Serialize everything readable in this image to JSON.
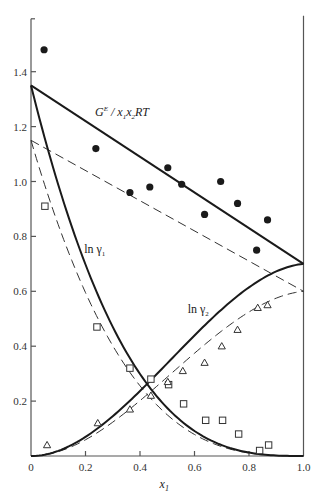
{
  "chart_data": {
    "type": "scatter",
    "title": "",
    "xlabel": "x1",
    "xlabel_display": {
      "base": "x",
      "sub": "1"
    },
    "ylabel": "",
    "xlim": [
      0,
      1.0
    ],
    "ylim": [
      0,
      1.6
    ],
    "grid": false,
    "legend": "none (inline curve labels)",
    "x_ticks": [
      0,
      0.2,
      0.4,
      0.6,
      0.8,
      1.0
    ],
    "x_tick_labels": [
      "0",
      "0.2",
      "0.4",
      "0.6",
      "0.8",
      "1.0"
    ],
    "y_ticks": [
      0.2,
      0.4,
      0.6,
      0.8,
      1.0,
      1.2,
      1.4
    ],
    "y_tick_labels": [
      "0.2",
      "0.4",
      "0.6",
      "0.8",
      "1.0",
      "1.2",
      "1.4"
    ],
    "annotations": [
      {
        "id": "ge",
        "text_parts": [
          "G",
          "E",
          " / x",
          "1",
          "x",
          "2",
          "RT"
        ],
        "label": "G^E/x1x2RT",
        "x": 0.235,
        "y": 1.24
      },
      {
        "id": "lng1",
        "label": "ln γ1",
        "base": "ln γ",
        "sub": "1",
        "x": 0.195,
        "y": 0.74
      },
      {
        "id": "lng2",
        "label": "ln γ2",
        "base": "ln γ",
        "sub": "2",
        "x": 0.575,
        "y": 0.52
      }
    ],
    "model_curves": {
      "description": "Margules two-parameter fits; GE/x1x2RT = A12*x2 + A21*x1",
      "solid": {
        "A12": 1.35,
        "A21": 0.7
      },
      "dashed": {
        "A12": 1.15,
        "A21": 0.6
      }
    },
    "series": [
      {
        "name": "GE/x1x2RT (solid line fit)",
        "type": "line",
        "style": "solid",
        "x": [
          0,
          1.0
        ],
        "y": [
          1.35,
          0.7
        ]
      },
      {
        "name": "GE/x1x2RT (dashed line fit)",
        "type": "line",
        "style": "dashed",
        "x": [
          0,
          1.0
        ],
        "y": [
          1.15,
          0.6
        ]
      },
      {
        "name": "ln γ1 (solid)",
        "type": "line",
        "style": "solid",
        "x": [
          0,
          0.1,
          0.2,
          0.3,
          0.4,
          0.5,
          0.6,
          0.7,
          0.8,
          0.9,
          1.0
        ],
        "y": [
          1.35,
          1.0,
          0.72,
          0.49,
          0.31,
          0.18,
          0.09,
          0.04,
          0.01,
          0.0,
          0.0
        ]
      },
      {
        "name": "ln γ2 (solid)",
        "type": "line",
        "style": "solid",
        "x": [
          0,
          0.1,
          0.2,
          0.3,
          0.4,
          0.5,
          0.6,
          0.7,
          0.8,
          0.9,
          1.0
        ],
        "y": [
          0.0,
          0.01,
          0.05,
          0.11,
          0.2,
          0.3,
          0.4,
          0.5,
          0.59,
          0.66,
          0.7
        ]
      },
      {
        "name": "ln γ1 (dashed)",
        "type": "line",
        "style": "dashed",
        "x": [
          0,
          0.1,
          0.2,
          0.3,
          0.4,
          0.5,
          0.6,
          0.7,
          0.8,
          0.9,
          1.0
        ],
        "y": [
          1.15,
          0.85,
          0.61,
          0.42,
          0.27,
          0.16,
          0.08,
          0.03,
          0.01,
          0.0,
          0.0
        ]
      },
      {
        "name": "ln γ2 (dashed)",
        "type": "line",
        "style": "dashed",
        "x": [
          0,
          0.1,
          0.2,
          0.3,
          0.4,
          0.5,
          0.6,
          0.7,
          0.8,
          0.9,
          1.0
        ],
        "y": [
          0.0,
          0.01,
          0.04,
          0.09,
          0.17,
          0.26,
          0.34,
          0.43,
          0.5,
          0.57,
          0.6
        ]
      },
      {
        "name": "GE/x1x2RT data",
        "type": "scatter",
        "marker": "filled-circle",
        "x": [
          0.048,
          0.238,
          0.363,
          0.436,
          0.502,
          0.553,
          0.637,
          0.696,
          0.758,
          0.828,
          0.868
        ],
        "y": [
          1.48,
          1.12,
          0.96,
          0.98,
          1.05,
          0.99,
          0.88,
          1.0,
          0.92,
          0.75,
          0.86
        ]
      },
      {
        "name": "ln γ1 data",
        "type": "scatter",
        "marker": "open-square",
        "x": [
          0.051,
          0.242,
          0.363,
          0.44,
          0.505,
          0.56,
          0.641,
          0.703,
          0.762,
          0.839,
          0.872
        ],
        "y": [
          0.91,
          0.47,
          0.32,
          0.28,
          0.26,
          0.19,
          0.13,
          0.13,
          0.08,
          0.02,
          0.04
        ]
      },
      {
        "name": "ln γ2 data",
        "type": "scatter",
        "marker": "open-triangle",
        "x": [
          0.059,
          0.245,
          0.363,
          0.44,
          0.502,
          0.557,
          0.637,
          0.7,
          0.758,
          0.832,
          0.868
        ],
        "y": [
          0.04,
          0.12,
          0.17,
          0.22,
          0.27,
          0.31,
          0.34,
          0.4,
          0.46,
          0.54,
          0.55
        ]
      }
    ]
  },
  "style": {
    "ink": "#1a1a1a",
    "axis": "#555555",
    "background": "#ffffff"
  }
}
